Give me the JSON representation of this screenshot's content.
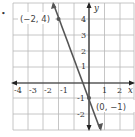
{
  "chart_data": {
    "type": "line",
    "title": "",
    "xlabel": "x",
    "ylabel": "y",
    "xlim": [
      -5,
      3
    ],
    "ylim": [
      -3,
      5
    ],
    "grid": true,
    "x_ticks": [
      "-4",
      "-3",
      "-2",
      "-1",
      "1",
      "2"
    ],
    "y_ticks": [
      "4",
      "3",
      "2",
      "1",
      "-1",
      "-2"
    ],
    "series": [
      {
        "name": "line",
        "equation": "y = -2.5x - 1",
        "points": [
          [
            -2,
            4
          ],
          [
            0,
            -1
          ]
        ],
        "color": "#555555"
      }
    ],
    "annotations": [
      {
        "label": "(−2, 4)",
        "x": -2,
        "y": 4
      },
      {
        "label": "(0, −1)",
        "x": 0,
        "y": -1
      }
    ]
  },
  "bullet": "•"
}
